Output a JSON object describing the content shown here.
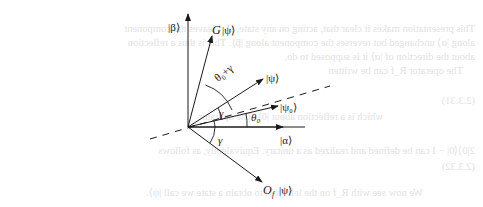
{
  "diagram": {
    "type": "vector-rotation",
    "labels": {
      "beta": "|β⟩",
      "g_psi_G": "G",
      "g_psi_ket": "|ψ⟩",
      "theta_gamma": "θ₀+γ",
      "psi": "|ψ⟩",
      "psi0": "|ψ₀⟩",
      "theta0": "θ₀",
      "alpha": "|α⟩",
      "gamma_top": "γ",
      "gamma_bottom": "γ",
      "of_O": "O",
      "of_sub": "f",
      "of_ket": "|ψ⟩"
    },
    "colors": {
      "ink": "#1a1a1a",
      "bleed": "#e2e2e2"
    }
  },
  "bleed_through": [
    "This presentation makes it clear that, acting on any state, O_f leaves the component",
    "along |α⟩ unchanged but reverses the component along |β⟩. This is thus a reflection",
    "about the direction of |α⟩ it is supposed to do.",
    "The operator R_f can be written",
    "(2.3.31)",
    "which is a reflection about |0⟩. The operator",
    "2|0⟩⟨0| − I can be defined and realized as a unitary. Equivalently, as follows",
    "(2.3.32)",
    "We now see with R_f on the left (|ψ⟩) to obtain a state we call |ψ⟩."
  ]
}
